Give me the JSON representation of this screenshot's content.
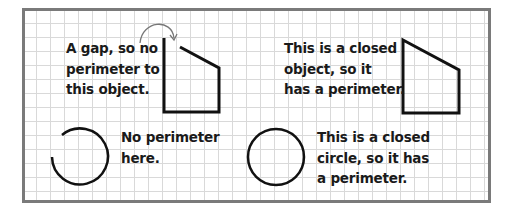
{
  "colors": {
    "border": "#7a7a7a",
    "grid": "#d9d9d9",
    "stroke": "#111111",
    "arrow": "#777777",
    "text": "#1a1a1a"
  },
  "panels": [
    {
      "id": "open-quadrilateral",
      "lines": [
        "A gap, so no",
        "perimeter to",
        "this object."
      ]
    },
    {
      "id": "closed-quadrilateral",
      "lines": [
        "This is a closed",
        "object, so it",
        "has a perimeter."
      ]
    },
    {
      "id": "open-circle",
      "lines": [
        "No perimeter",
        "here."
      ]
    },
    {
      "id": "closed-circle",
      "lines": [
        "This is a closed",
        "circle, so it has",
        "a perimeter."
      ]
    }
  ],
  "shapes": {
    "open_quadrilateral": {
      "type": "polyline",
      "has_gap": true,
      "gap_arrow": "curved-arrow"
    },
    "closed_quadrilateral": {
      "type": "polygon",
      "has_gap": false
    },
    "open_circle": {
      "type": "arc",
      "has_gap": true
    },
    "closed_circle": {
      "type": "circle",
      "has_gap": false
    }
  }
}
